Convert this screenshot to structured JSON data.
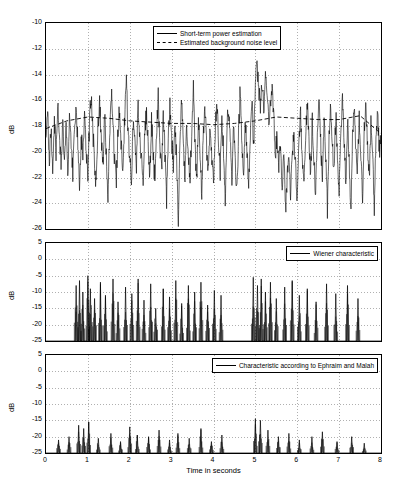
{
  "chart_data": [
    {
      "type": "line",
      "title": "",
      "xlabel": "",
      "ylabel": "dB",
      "xlim": [
        0,
        8
      ],
      "ylim": [
        -26,
        -10
      ],
      "yticks": [
        -10,
        -12,
        -14,
        -16,
        -18,
        -20,
        -22,
        -24,
        -26
      ],
      "xticks": [
        0,
        1,
        2,
        3,
        4,
        5,
        6,
        7,
        8
      ],
      "xticklabels": [
        "",
        "",
        "",
        "",
        "",
        "",
        "",
        "",
        ""
      ],
      "yticklabels": [
        "-10",
        "-12",
        "-14",
        "-16",
        "-18",
        "-20",
        "-22",
        "-24",
        "-26"
      ],
      "grid": true,
      "legend_position": "top-center",
      "legend": [
        {
          "label": "Short-term power estimation",
          "style": "solid"
        },
        {
          "label": "Estimated background noise level",
          "style": "dashed"
        }
      ],
      "series": [
        {
          "name": "Short-term power estimation",
          "style": "solid",
          "x": [
            0.0,
            0.04,
            0.08,
            0.12,
            0.16,
            0.2,
            0.24,
            0.28,
            0.32,
            0.36,
            0.4,
            0.44,
            0.48,
            0.52,
            0.56,
            0.6,
            0.64,
            0.68,
            0.72,
            0.76,
            0.8,
            0.84,
            0.88,
            0.92,
            0.96,
            1.0,
            1.04,
            1.08,
            1.12,
            1.16,
            1.2,
            1.24,
            1.28,
            1.32,
            1.36,
            1.4,
            1.44,
            1.48,
            1.52,
            1.56,
            1.6,
            1.64,
            1.68,
            1.72,
            1.76,
            1.8,
            1.84,
            1.88,
            1.92,
            1.96,
            2.0,
            2.04,
            2.08,
            2.12,
            2.16,
            2.2,
            2.24,
            2.28,
            2.32,
            2.36,
            2.4,
            2.44,
            2.48,
            2.52,
            2.56,
            2.6,
            2.64,
            2.68,
            2.72,
            2.76,
            2.8,
            2.84,
            2.88,
            2.92,
            2.96,
            3.0,
            3.04,
            3.08,
            3.12,
            3.16,
            3.2,
            3.24,
            3.28,
            3.32,
            3.36,
            3.4,
            3.44,
            3.48,
            3.52,
            3.56,
            3.6,
            3.64,
            3.68,
            3.72,
            3.76,
            3.8,
            3.84,
            3.88,
            3.92,
            3.96,
            4.0,
            4.04,
            4.08,
            4.12,
            4.16,
            4.2,
            4.24,
            4.28,
            4.32,
            4.36,
            4.4,
            4.44,
            4.48,
            4.52,
            4.56,
            4.6,
            4.64,
            4.68,
            4.72,
            4.76,
            4.8,
            4.84,
            4.88,
            4.92,
            4.96,
            5.0,
            5.04,
            5.08,
            5.12,
            5.16,
            5.2,
            5.24,
            5.28,
            5.32,
            5.36,
            5.4,
            5.44,
            5.48,
            5.52,
            5.56,
            5.6,
            5.64,
            5.68,
            5.72,
            5.76,
            5.8,
            5.84,
            5.88,
            5.92,
            5.96,
            6.0,
            6.04,
            6.08,
            6.12,
            6.16,
            6.2,
            6.24,
            6.28,
            6.32,
            6.36,
            6.4,
            6.44,
            6.48,
            6.52,
            6.56,
            6.6,
            6.64,
            6.68,
            6.72,
            6.76,
            6.8,
            6.84,
            6.88,
            6.92,
            6.96,
            7.0,
            7.04,
            7.08,
            7.12,
            7.16,
            7.2,
            7.24,
            7.28,
            7.32,
            7.36,
            7.4,
            7.44,
            7.48,
            7.52,
            7.56,
            7.6,
            7.64,
            7.68,
            7.72,
            7.76,
            7.8,
            7.84,
            7.88,
            7.92,
            7.96,
            8.0
          ],
          "y": [
            -19.2,
            -17.0,
            -20.5,
            -18.2,
            -21.3,
            -17.4,
            -20.0,
            -16.4,
            -19.0,
            -21.0,
            -17.8,
            -20.8,
            -18.0,
            -22.0,
            -17.2,
            -19.6,
            -21.6,
            -18.6,
            -16.2,
            -19.4,
            -22.4,
            -18.8,
            -20.2,
            -16.8,
            -19.9,
            -21.8,
            -17.6,
            -15.6,
            -18.4,
            -20.6,
            -22.8,
            -18.1,
            -16.0,
            -19.1,
            -21.2,
            -17.1,
            -20.3,
            -23.4,
            -18.7,
            -15.4,
            -17.9,
            -20.9,
            -22.2,
            -18.3,
            -16.6,
            -19.8,
            -21.4,
            -17.3,
            -14.0,
            -18.9,
            -20.1,
            -22.6,
            -17.7,
            -19.3,
            -21.0,
            -16.3,
            -18.5,
            -20.7,
            -23.0,
            -18.0,
            -16.9,
            -19.5,
            -21.9,
            -17.5,
            -20.4,
            -22.1,
            -18.2,
            -15.8,
            -19.7,
            -21.5,
            -17.0,
            -20.0,
            -23.8,
            -18.4,
            -16.5,
            -19.0,
            -21.1,
            -17.8,
            -20.6,
            -25.4,
            -18.6,
            -16.1,
            -19.2,
            -22.0,
            -17.4,
            -20.8,
            -21.7,
            -18.8,
            -15.2,
            -19.6,
            -22.3,
            -17.2,
            -20.2,
            -23.2,
            -18.1,
            -16.7,
            -19.9,
            -21.3,
            -17.6,
            -20.5,
            -22.7,
            -18.3,
            -15.9,
            -19.4,
            -21.6,
            -17.1,
            -20.0,
            -24.2,
            -18.0,
            -16.4,
            -19.1,
            -22.5,
            -17.9,
            -20.9,
            -23.1,
            -18.5,
            -15.0,
            -19.3,
            -21.8,
            -17.3,
            -20.1,
            -22.9,
            -18.7,
            -16.2,
            -19.7,
            -14.2,
            -13.6,
            -15.1,
            -17.0,
            -14.5,
            -16.8,
            -13.9,
            -15.5,
            -18.2,
            -16.0,
            -14.8,
            -17.4,
            -20.0,
            -18.9,
            -21.4,
            -19.2,
            -22.6,
            -20.4,
            -24.6,
            -22.0,
            -19.8,
            -23.2,
            -20.6,
            -18.4,
            -21.0,
            -24.0,
            -19.5,
            -17.2,
            -20.3,
            -22.8,
            -18.6,
            -16.3,
            -19.0,
            -21.7,
            -17.5,
            -20.8,
            -23.6,
            -18.2,
            -16.0,
            -19.4,
            -22.2,
            -17.8,
            -20.5,
            -24.4,
            -18.9,
            -16.6,
            -19.6,
            -21.5,
            -17.1,
            -20.0,
            -23.0,
            -18.3,
            -15.7,
            -19.2,
            -22.4,
            -17.6,
            -20.7,
            -25.0,
            -18.8,
            -16.8,
            -19.9,
            -21.2,
            -17.4,
            -20.2,
            -23.4,
            -18.0,
            -16.4,
            -19.5,
            -22.1,
            -17.9,
            -20.4,
            -24.8,
            -18.5,
            -17.0,
            -19.8,
            -19.1
          ]
        },
        {
          "name": "Estimated background noise level",
          "style": "dashed",
          "x": [
            0.0,
            0.5,
            1.0,
            1.5,
            2.0,
            2.5,
            3.0,
            3.5,
            4.0,
            4.5,
            5.0,
            5.5,
            6.0,
            6.5,
            7.0,
            7.5,
            8.0
          ],
          "y": [
            -18.2,
            -17.6,
            -17.3,
            -17.4,
            -17.6,
            -17.7,
            -17.8,
            -17.8,
            -17.9,
            -17.8,
            -17.6,
            -17.3,
            -17.4,
            -17.5,
            -17.5,
            -17.2,
            -18.6
          ]
        }
      ]
    },
    {
      "type": "line",
      "title": "",
      "xlabel": "",
      "ylabel": "dB",
      "xlim": [
        0,
        8
      ],
      "ylim": [
        -25,
        5
      ],
      "yticks": [
        5,
        0,
        -5,
        -10,
        -15,
        -20,
        -25
      ],
      "yticklabels": [
        "5",
        "0",
        "-5",
        "-10",
        "-15",
        "-20",
        "-25"
      ],
      "xticks": [
        0,
        1,
        2,
        3,
        4,
        5,
        6,
        7,
        8
      ],
      "xticklabels": [
        "",
        "",
        "",
        "",
        "",
        "",
        "",
        "",
        ""
      ],
      "grid": true,
      "legend_position": "top-right",
      "legend": [
        {
          "label": "Wiener characteristic",
          "style": "solid"
        }
      ],
      "series": [
        {
          "name": "Wiener characteristic",
          "style": "solid",
          "baseline": -25,
          "spikes": [
            {
              "x": 0.72,
              "y": -8.0
            },
            {
              "x": 0.8,
              "y": -6.5
            },
            {
              "x": 0.88,
              "y": -10.0
            },
            {
              "x": 1.0,
              "y": -5.0
            },
            {
              "x": 1.06,
              "y": -9.0
            },
            {
              "x": 1.16,
              "y": -12.0
            },
            {
              "x": 1.3,
              "y": -7.0
            },
            {
              "x": 1.42,
              "y": -11.0
            },
            {
              "x": 1.6,
              "y": -6.0
            },
            {
              "x": 1.72,
              "y": -13.0
            },
            {
              "x": 1.9,
              "y": -8.5
            },
            {
              "x": 2.05,
              "y": -10.5
            },
            {
              "x": 2.2,
              "y": -6.0
            },
            {
              "x": 2.34,
              "y": -12.5
            },
            {
              "x": 2.5,
              "y": -7.5
            },
            {
              "x": 2.62,
              "y": -15.0
            },
            {
              "x": 2.8,
              "y": -9.0
            },
            {
              "x": 2.95,
              "y": -11.5
            },
            {
              "x": 3.1,
              "y": -6.5
            },
            {
              "x": 3.24,
              "y": -13.5
            },
            {
              "x": 3.4,
              "y": -8.0
            },
            {
              "x": 3.55,
              "y": -10.0
            },
            {
              "x": 3.7,
              "y": -7.0
            },
            {
              "x": 3.86,
              "y": -14.0
            },
            {
              "x": 4.02,
              "y": -9.5
            },
            {
              "x": 4.18,
              "y": -11.0
            },
            {
              "x": 4.95,
              "y": -5.5
            },
            {
              "x": 5.05,
              "y": -8.0
            },
            {
              "x": 5.14,
              "y": -6.0
            },
            {
              "x": 5.24,
              "y": -10.0
            },
            {
              "x": 5.36,
              "y": -7.0
            },
            {
              "x": 5.5,
              "y": -12.0
            },
            {
              "x": 5.7,
              "y": -8.5
            },
            {
              "x": 5.88,
              "y": -6.5
            },
            {
              "x": 6.05,
              "y": -11.0
            },
            {
              "x": 6.24,
              "y": -9.0
            },
            {
              "x": 6.45,
              "y": -13.0
            },
            {
              "x": 6.7,
              "y": -7.5
            },
            {
              "x": 6.92,
              "y": -10.5
            },
            {
              "x": 7.2,
              "y": -8.0
            },
            {
              "x": 7.45,
              "y": -12.0
            }
          ]
        }
      ]
    },
    {
      "type": "line",
      "title": "",
      "xlabel": "Time in seconds",
      "ylabel": "dB",
      "xlim": [
        0,
        8
      ],
      "ylim": [
        -25,
        5
      ],
      "yticks": [
        5,
        0,
        -5,
        -10,
        -15,
        -20,
        -25
      ],
      "yticklabels": [
        "5",
        "0",
        "-5",
        "-10",
        "-15",
        "-20",
        "-25"
      ],
      "xticks": [
        0,
        1,
        2,
        3,
        4,
        5,
        6,
        7,
        8
      ],
      "xticklabels": [
        "0",
        "1",
        "2",
        "3",
        "4",
        "5",
        "6",
        "7",
        "8"
      ],
      "grid": true,
      "legend_position": "top-right",
      "legend": [
        {
          "label": "Characteristic according to Ephraim and Malah",
          "style": "solid"
        }
      ],
      "series": [
        {
          "name": "Characteristic according to Ephraim and Malah",
          "style": "solid",
          "baseline": -25,
          "spikes": [
            {
              "x": 0.3,
              "y": -21.0
            },
            {
              "x": 0.55,
              "y": -20.0
            },
            {
              "x": 0.78,
              "y": -16.5
            },
            {
              "x": 0.9,
              "y": -17.5
            },
            {
              "x": 1.02,
              "y": -15.5
            },
            {
              "x": 1.25,
              "y": -20.5
            },
            {
              "x": 1.55,
              "y": -19.0
            },
            {
              "x": 1.78,
              "y": -21.5
            },
            {
              "x": 2.0,
              "y": -17.0
            },
            {
              "x": 2.18,
              "y": -19.5
            },
            {
              "x": 2.45,
              "y": -20.0
            },
            {
              "x": 2.7,
              "y": -18.0
            },
            {
              "x": 2.95,
              "y": -21.0
            },
            {
              "x": 3.15,
              "y": -19.0
            },
            {
              "x": 3.42,
              "y": -20.5
            },
            {
              "x": 3.7,
              "y": -17.5
            },
            {
              "x": 3.95,
              "y": -21.5
            },
            {
              "x": 4.2,
              "y": -19.5
            },
            {
              "x": 5.0,
              "y": -14.5
            },
            {
              "x": 5.12,
              "y": -15.0
            },
            {
              "x": 5.3,
              "y": -18.0
            },
            {
              "x": 5.55,
              "y": -20.0
            },
            {
              "x": 5.8,
              "y": -19.0
            },
            {
              "x": 6.05,
              "y": -21.0
            },
            {
              "x": 6.35,
              "y": -20.0
            },
            {
              "x": 6.6,
              "y": -18.5
            },
            {
              "x": 6.95,
              "y": -21.5
            },
            {
              "x": 7.3,
              "y": -20.0
            },
            {
              "x": 7.6,
              "y": -22.0
            }
          ]
        }
      ]
    }
  ],
  "figure": {
    "panels": [
      {
        "ylabel": "dB",
        "legend": [
          "Short-term power estimation",
          "Estimated background noise level"
        ]
      },
      {
        "ylabel": "dB",
        "legend": [
          "Wiener characteristic"
        ]
      },
      {
        "ylabel": "dB",
        "xlabel": "Time in seconds",
        "legend": [
          "Characteristic according to Ephraim and Malah"
        ]
      }
    ]
  }
}
